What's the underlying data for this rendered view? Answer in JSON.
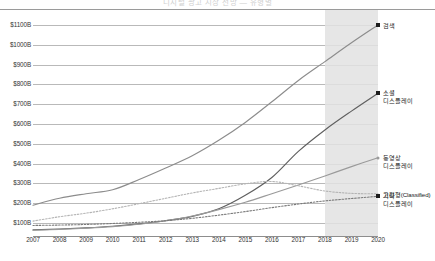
{
  "page": {
    "top_cut_text": "디지털 광고 시장 전망 — 유형별"
  },
  "chart_data": {
    "type": "line",
    "title": "",
    "xlabel": "",
    "ylabel": "",
    "x": [
      2007,
      2008,
      2009,
      2010,
      2011,
      2012,
      2013,
      2014,
      2015,
      2016,
      2017,
      2018,
      2019,
      2020
    ],
    "xtick_labels": [
      "2007",
      "2008",
      "2009",
      "2010",
      "2011",
      "2012",
      "2013",
      "2014",
      "2015",
      "2016",
      "2017",
      "2018",
      "2019",
      "2020"
    ],
    "ytick_labels": [
      "$1100B",
      "$1000B",
      "$900B",
      "$800B",
      "$700B",
      "$600B",
      "$500B",
      "$400B",
      "$300B",
      "$200B",
      "$100B"
    ],
    "ytick_values": [
      1100,
      1000,
      900,
      800,
      700,
      600,
      500,
      400,
      300,
      200,
      100
    ],
    "ylim": [
      60,
      1130
    ],
    "yunit": "B",
    "grid": true,
    "legend_position": "right-inline",
    "forecast_band": {
      "from": 2018,
      "to": 2020,
      "color": "#e2e2e2"
    },
    "series": [
      {
        "name": "검색",
        "label_line1": "검색",
        "label_line2": "",
        "color": "#8c8c8c",
        "style": "solid",
        "end_marker": "square",
        "values": [
          190,
          225,
          248,
          268,
          320,
          378,
          440,
          518,
          608,
          712,
          820,
          915,
          1010,
          1100
        ]
      },
      {
        "name": "소셜 디스플레이",
        "label_line1": "소셜",
        "label_line2": "디스플레이",
        "color": "#5f5f5f",
        "style": "solid",
        "end_marker": "square",
        "values": [
          66,
          70,
          76,
          84,
          96,
          112,
          134,
          172,
          240,
          330,
          462,
          570,
          665,
          755
        ]
      },
      {
        "name": "동영상 디스플레이",
        "label_line1": "동영상",
        "label_line2": "디스플레이",
        "color": "#9a9a9a",
        "style": "solid",
        "end_marker": "dot",
        "values": [
          64,
          68,
          74,
          82,
          94,
          112,
          136,
          168,
          205,
          248,
          292,
          338,
          385,
          430
        ]
      },
      {
        "name": "고정형(Classified)",
        "label_line1": "고정형(Classified)",
        "label_line2": "",
        "color": "#b4b4b4",
        "style": "dotted",
        "end_marker": "none",
        "values": [
          110,
          132,
          150,
          172,
          198,
          225,
          252,
          275,
          298,
          310,
          288,
          262,
          250,
          248
        ]
      },
      {
        "name": "기타 디스플레이",
        "label_line1": "기타",
        "label_line2": "디스플레이",
        "color": "#7a7a7a",
        "style": "dotted",
        "end_marker": "square",
        "values": [
          88,
          90,
          93,
          98,
          104,
          112,
          124,
          140,
          158,
          178,
          196,
          212,
          224,
          235
        ]
      }
    ]
  }
}
